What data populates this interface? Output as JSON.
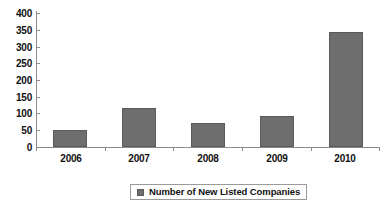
{
  "chart_data": {
    "type": "bar",
    "title": "",
    "xlabel": "",
    "ylabel": "",
    "categories": [
      "2006",
      "2007",
      "2008",
      "2009",
      "2010"
    ],
    "series": [
      {
        "name": "Number of New Listed Companies",
        "values": [
          52,
          117,
          73,
          93,
          343
        ],
        "color": "#6e6e6e"
      }
    ],
    "ylim": [
      0,
      400
    ],
    "ytick_labels": [
      "400",
      "350",
      "300",
      "250",
      "200",
      "150",
      "100",
      "50",
      "0"
    ],
    "ytick_values": [
      400,
      350,
      300,
      250,
      200,
      150,
      100,
      50,
      0
    ],
    "ytick_step": 50,
    "grid": false,
    "legend": {
      "position": "bottom",
      "entries": [
        {
          "label": "Number of New Listed Companies",
          "color": "#6e6e6e"
        }
      ]
    },
    "axis_color": "#8c8c8c",
    "background": "#ffffff"
  }
}
